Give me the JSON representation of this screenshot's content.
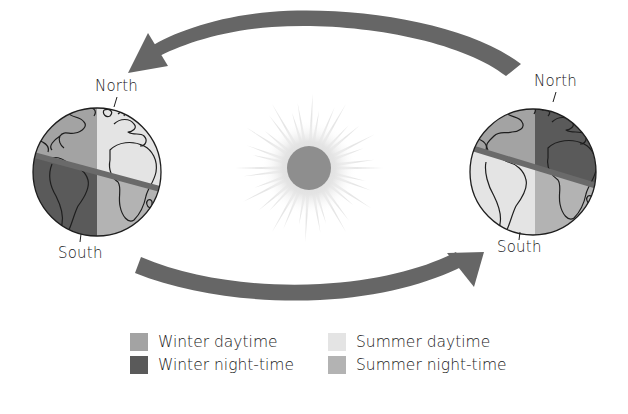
{
  "diagram": {
    "type": "seasons-earth-orbit",
    "globes": [
      {
        "id": "left",
        "north_label": "North",
        "south_label": "South",
        "quadrants": {
          "north_west": "winter_day",
          "north_east": "summer_day",
          "south_west": "winter_night",
          "south_east": "summer_night"
        }
      },
      {
        "id": "right",
        "north_label": "North",
        "south_label": "South",
        "quadrants": {
          "north_west": "winter_day",
          "north_east": "winter_night",
          "south_west": "summer_day",
          "south_east": "summer_night"
        }
      }
    ],
    "sun": {
      "name": "Sun"
    },
    "arrows": [
      {
        "id": "top",
        "direction": "right-to-left"
      },
      {
        "id": "bottom",
        "direction": "left-to-right"
      }
    ]
  },
  "colors": {
    "winter_day": "#a3a3a3",
    "winter_night": "#5a5a5a",
    "summer_day": "#e4e4e4",
    "summer_night": "#b3b3b3",
    "arrow": "#666666",
    "equator": "#6a6a6a",
    "sun_core": "#8e8e8e",
    "sun_rays": "#e2e2e2",
    "outline": "#1e1e1e"
  },
  "legend": {
    "items": [
      {
        "key": "winter_day",
        "label": "Winter daytime"
      },
      {
        "key": "winter_night",
        "label": "Winter night-time"
      },
      {
        "key": "summer_day",
        "label": "Summer daytime"
      },
      {
        "key": "summer_night",
        "label": "Summer night-time"
      }
    ]
  }
}
